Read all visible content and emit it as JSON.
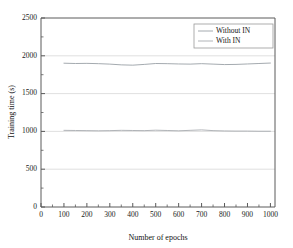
{
  "chart_data": {
    "type": "line",
    "title": "",
    "xlabel": "Number of epochs",
    "ylabel": "Training time (s)",
    "xlim": [
      0,
      1020
    ],
    "ylim": [
      0,
      2500
    ],
    "xticks": [
      0,
      100,
      200,
      300,
      400,
      500,
      600,
      700,
      800,
      900,
      1000
    ],
    "yticks": [
      0,
      500,
      1000,
      1500,
      2000,
      2500
    ],
    "xtick_labels": [
      "0",
      "100",
      "200",
      "300",
      "400",
      "500",
      "600",
      "700",
      "800",
      "900",
      "1000"
    ],
    "ytick_labels": [
      "0",
      "500",
      "1000",
      "1500",
      "2000",
      "2500"
    ],
    "grid": true,
    "grid_axis": "y",
    "legend_position": "upper-right",
    "x": [
      100,
      150,
      200,
      250,
      300,
      350,
      400,
      450,
      500,
      550,
      600,
      650,
      700,
      750,
      800,
      850,
      900,
      950,
      1000
    ],
    "series": [
      {
        "name": "Without IN",
        "color": "#9aa0a6",
        "values": [
          1902,
          1898,
          1900,
          1896,
          1890,
          1880,
          1876,
          1886,
          1898,
          1896,
          1892,
          1890,
          1896,
          1890,
          1884,
          1886,
          1892,
          1898,
          1904
        ]
      },
      {
        "name": "With IN",
        "color": "#a8acb0",
        "values": [
          1014,
          1012,
          1010,
          1008,
          1010,
          1014,
          1012,
          1010,
          1016,
          1012,
          1008,
          1014,
          1020,
          1010,
          1006,
          1004,
          1004,
          1002,
          1002
        ]
      }
    ]
  },
  "legend": {
    "entries": [
      {
        "label": "Without IN"
      },
      {
        "label": "With IN"
      }
    ]
  },
  "axes": {
    "x_title": "Number of epochs",
    "y_title": "Training time (s)"
  },
  "colors": {
    "axis": "#5a5a5a",
    "grid": "#d8d8d8",
    "background": "#ffffff",
    "text": "#1a1a1a"
  }
}
